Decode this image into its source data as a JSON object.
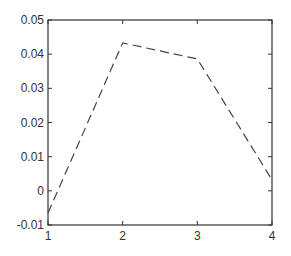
{
  "chart_data": {
    "type": "line",
    "title": "",
    "xlabel": "",
    "ylabel": "",
    "x": [
      1,
      2,
      3,
      4
    ],
    "series": [
      {
        "name": "series1",
        "values": [
          -0.0065,
          0.0433,
          0.0386,
          0.0032
        ],
        "style": "dashed",
        "color": "#444444"
      }
    ],
    "xlim": [
      1,
      4
    ],
    "ylim": [
      -0.01,
      0.05
    ],
    "xticks": [
      1,
      2,
      3,
      4
    ],
    "xtick_labels": [
      "1",
      "2",
      "3",
      "4"
    ],
    "yticks": [
      -0.01,
      0,
      0.01,
      0.02,
      0.03,
      0.04,
      0.05
    ],
    "ytick_labels": [
      "-0.01",
      "0",
      "0.01",
      "0.02",
      "0.03",
      "0.04",
      "0.05"
    ],
    "grid": false,
    "legend": null
  }
}
